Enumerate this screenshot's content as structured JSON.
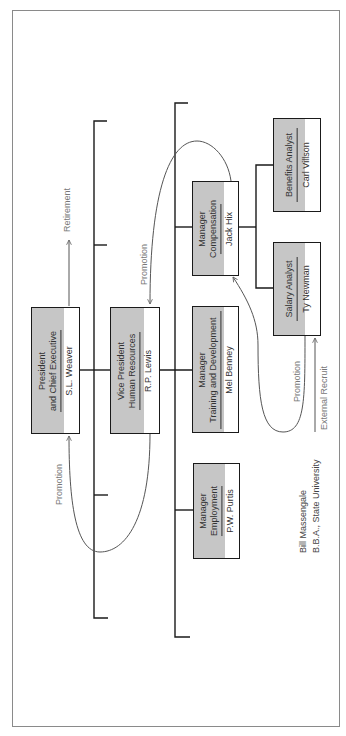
{
  "diagram": {
    "type": "organization-chart-career-paths",
    "positions": {
      "president": {
        "title_line1": "President",
        "title_line2": "and Chief Executive",
        "person": "S.L. Weaver"
      },
      "vp_hr": {
        "title_line1": "Vice President",
        "title_line2": "Human Resources",
        "person": "R.P. Lewis"
      },
      "mgr_compensation": {
        "title_line1": "Manager",
        "title_line2": "Compensation",
        "person": "Jack Hix"
      },
      "mgr_training": {
        "title_line1": "Manager",
        "title_line2": "Training and Development",
        "person": "Mel Benney"
      },
      "mgr_employment": {
        "title_line1": "Manager",
        "title_line2": "Employment",
        "person": "P.W. Purtis"
      },
      "benefits_analyst": {
        "title_line1": "Benefits Analyst",
        "person": "Carl Villson"
      },
      "salary_analyst": {
        "title_line1": "Salary Analyst",
        "person": "Ty Newman"
      }
    },
    "flows": {
      "retirement": "Retirement",
      "promotion_to_president": "Promotion",
      "promotion_to_vp": "Promotion",
      "promotion_to_mgr_comp": "Promotion",
      "external_recruit": "External Recruit"
    },
    "recruit": {
      "name": "Bill Massengale",
      "credential": "B.B.A., State University"
    },
    "colors": {
      "box_shade": "#c6c6c6",
      "line": "#1a1a1a",
      "flow_line": "#666666",
      "frame": "#8a8a8a"
    }
  }
}
